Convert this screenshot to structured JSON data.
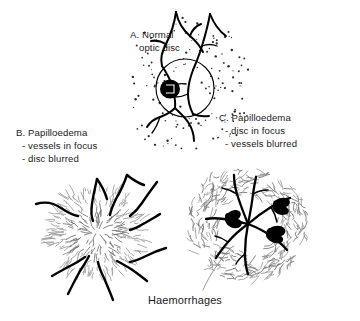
{
  "figure": {
    "title_absent": true,
    "background_color": "#ffffff",
    "ink_color": "#000000",
    "blur_color": "#9a9a9a",
    "text_color": "#1a1a1a"
  },
  "labels": {
    "panel_a": {
      "lines": [
        "A. Normal",
        "optic disc"
      ],
      "x": 130,
      "y": 35
    },
    "panel_b": {
      "lines": [
        "B. Papilloedema",
        "- vessels in focus",
        "- disc blurred"
      ],
      "x": 16,
      "y": 133
    },
    "panel_c": {
      "lines": [
        "C. Papilloedema",
        "- disc in focus",
        "- vessels blurred"
      ],
      "x": 219,
      "y": 118
    },
    "haemorrhages": {
      "text": "Haemorrhages",
      "x": 185,
      "y": 301
    }
  },
  "panels": [
    {
      "id": "A",
      "name": "normal-optic-disc",
      "center": [
        185,
        88
      ],
      "disc_radius": 29,
      "cup": {
        "center": [
          170,
          89
        ],
        "rx": 10,
        "ry": 9.5
      },
      "description": "Normal optic disc: sharp disc margin, dark central cup, vessels in focus, stippled retina"
    },
    {
      "id": "B",
      "name": "papilloedema-disc-blurred",
      "center": [
        97,
        232
      ],
      "blur_radius": 46,
      "description": "Papilloedema with vessels in focus and blurred swollen disc"
    },
    {
      "id": "C",
      "name": "papilloedema-vessels-blurred",
      "center": [
        248,
        224
      ],
      "blur_inner_radius": 30,
      "blur_outer_radius": 60,
      "haemorrhage_count": 3,
      "description": "Papilloedema with disc in focus, blurred vessels and flame haemorrhages"
    }
  ],
  "graphics": {
    "panel_a_vessels": [
      "M176,12 C174,26 170,36 166,44 C162,52 160,58 162,66",
      "M176,12 C178,22 183,30 190,36 C196,41 200,46 203,52",
      "M166,44 C161,41 156,40 151,41",
      "M190,36 C192,30 196,26 201,24",
      "M210,14 C208,26 205,36 202,46 C199,56 196,63 193,70",
      "M210,14 C214,24 219,31 226,36",
      "M202,46 C207,44 212,44 217,46",
      "M162,66 C166,72 170,78 172,86 C174,94 176,100 175,108",
      "M193,70 C190,78 188,86 188,94 C188,102 190,108 193,114",
      "M175,108 C171,112 166,115 160,117 C154,119 150,122 147,127",
      "M175,108 C179,112 184,116 188,122 C192,128 194,134 194,141",
      "M193,114 C198,116 203,117 209,116",
      "M160,117 C158,123 156,128 152,133",
      "M172,86 C176,84 181,83 186,84",
      "M188,94 C184,96 180,97 175,97"
    ],
    "panel_a_stipple_seed": 7,
    "panel_a_stipple_count": 150,
    "panel_b_vessels": [
      "M36,204 C46,201 54,203 61,208 C67,212 72,215 78,216",
      "M97,179 C95,188 93,196 92,204 C91,211 91,216 93,221",
      "M97,179 C102,186 105,192 107,199",
      "M127,175 C124,184 120,192 116,199 C113,205 111,210 110,215",
      "M127,175 C133,180 138,183 144,185",
      "M157,182 C151,190 146,197 142,203 C138,209 134,213 130,216",
      "M160,214 C154,218 148,221 143,224 C138,227 134,229 130,230",
      "M166,248 C159,250 152,253 146,256 C140,259 135,261 130,262",
      "M147,281 C142,277 137,273 131,269 C126,266 121,263 117,261",
      "M113,300 C110,292 107,285 104,278 C101,272 99,267 98,262",
      "M68,294 C72,286 76,278 80,271 C84,265 87,260 89,256",
      "M52,276 C59,272 66,268 72,265 C78,262 82,259 85,257"
    ],
    "panel_c_vessels": [
      "M248,224 C244,214 240,204 237,194 C235,187 234,181 234,175",
      "M248,224 C250,214 252,204 253,194 C254,187 255,182 256,177",
      "M248,224 C255,218 263,212 271,207 C278,203 284,200 290,198",
      "M248,224 C256,227 264,231 271,236 C278,241 283,245 287,250",
      "M248,224 C241,229 234,235 228,242 C223,248 219,253 216,258",
      "M248,224 C240,222 232,220 224,219 C217,218 211,218 206,219",
      "M248,224 C246,234 245,244 245,254 C245,262 246,268 248,274",
      "M237,194 C232,191 227,189 222,188",
      "M253,194 C258,191 263,190 268,190",
      "M271,207 C274,212 276,217 277,222",
      "M228,242 C224,239 220,237 215,236",
      "M245,254 C241,257 238,260 236,264"
    ],
    "panel_c_haemorrhages": [
      "M228,213 C232,210 236,209 239,211 C242,213 241,217 238,219 C241,220 243,223 241,226 C238,229 233,229 229,226 C226,224 224,220 225,217 C225,214 226,213 228,213 Z",
      "M276,200 C281,197 286,197 289,200 C291,203 289,206 286,207 C289,209 290,212 287,214 C283,216 278,215 275,212 C272,209 272,204 274,201 Z",
      "M270,228 C275,225 281,225 284,228 C287,231 285,235 281,236 C284,238 284,242 280,243 C275,244 270,242 267,238 C265,235 266,230 269,228 Z"
    ],
    "leader_line": "M203,290 C207,281 212,272 218,264 C222,258 226,253 230,249"
  }
}
